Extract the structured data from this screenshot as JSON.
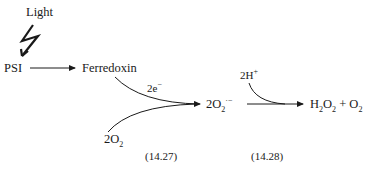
{
  "diagram": {
    "light_label": "Light",
    "nodes": {
      "psi": "PSI",
      "ferredoxin": "Ferredoxin",
      "electrons": "2e",
      "electrons_charge": "−",
      "oxygen_coef": "2O",
      "oxygen_sub": "2",
      "superoxide_coef": "2O",
      "superoxide_sub": "2",
      "superoxide_sup": "·−",
      "protons": "2H",
      "protons_sup": "+",
      "product_h": "H",
      "product_h_sub": "2",
      "product_o": "O",
      "product_o_sub": "2",
      "product_plus": " + O",
      "product_o2_sub": "2"
    },
    "equations": [
      "(14.27)",
      "(14.28)"
    ]
  }
}
